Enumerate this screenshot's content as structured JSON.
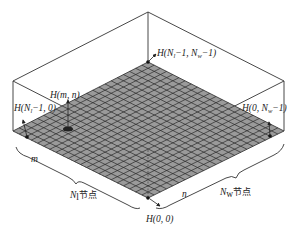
{
  "diagram": {
    "type": "isometric-grid-mesh",
    "colors": {
      "grid_fill": "#9a9a9a",
      "grid_lines": "#2a2a2a",
      "box_lines": "#333333",
      "background": "#ffffff"
    },
    "labels": {
      "top_corner": {
        "prefix": "H(N",
        "sub": "l",
        "mid": "−1, N",
        "sub2": "w",
        "suffix": "−1)"
      },
      "left_corner": {
        "prefix": "H(N",
        "sub": "l",
        "suffix": "−1, 0)"
      },
      "right_corner": {
        "prefix": "H(0, N",
        "sub": "w",
        "suffix": "−1)"
      },
      "bottom_corner": "H(0, 0)",
      "interior_point": "H(m, n)",
      "axis_m": "m",
      "axis_n": "n",
      "length_nodes": {
        "symbol": "N",
        "sub": "l",
        "text": "节点"
      },
      "width_nodes": {
        "symbol": "N",
        "sub": "w",
        "text": "节点"
      }
    },
    "grid": {
      "divisions_l": 22,
      "divisions_w": 22
    }
  }
}
